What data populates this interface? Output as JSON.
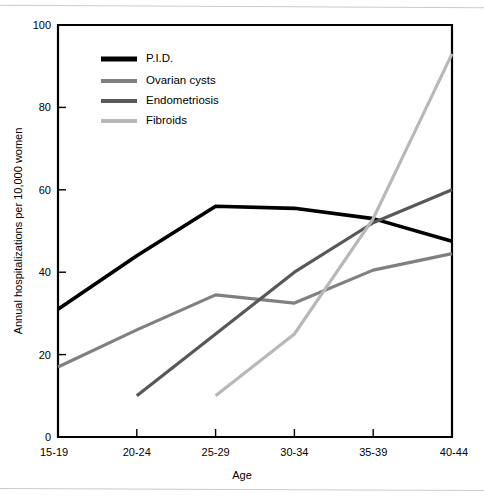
{
  "chart_data": {
    "type": "line",
    "title": "",
    "xlabel": "Age",
    "ylabel": "Annual hospitalizations per 10,000 women",
    "categories": [
      "15-19",
      "20-24",
      "25-29",
      "30-34",
      "35-39",
      "40-44"
    ],
    "ylim": [
      0,
      100
    ],
    "yticks": [
      0,
      20,
      40,
      60,
      80,
      100
    ],
    "ytick_labels": [
      "0",
      "20",
      "40",
      "60",
      "80",
      "100"
    ],
    "grid": false,
    "legend_position": "top-left inside axes",
    "series": [
      {
        "name": "P.I.D.",
        "color": "#000000",
        "width": 3.6,
        "x": [
          "15-19",
          "20-24",
          "25-29",
          "30-34",
          "35-39",
          "40-44"
        ],
        "values": [
          31,
          44,
          56,
          55.5,
          53,
          47.5
        ]
      },
      {
        "name": "Ovarian cysts",
        "color": "#808080",
        "width": 3.2,
        "x": [
          "15-19",
          "20-24",
          "25-29",
          "30-34",
          "35-39",
          "40-44"
        ],
        "values": [
          17,
          26,
          34.5,
          32.5,
          40.5,
          44.5
        ]
      },
      {
        "name": "Endometriosis",
        "color": "#585858",
        "width": 3.2,
        "x": [
          "20-24",
          "25-29",
          "30-34",
          "35-39",
          "40-44"
        ],
        "values": [
          10,
          25,
          40,
          52,
          60
        ]
      },
      {
        "name": "Fibroids",
        "color": "#b8b8b8",
        "width": 3.2,
        "x": [
          "25-29",
          "30-34",
          "35-39",
          "40-44"
        ],
        "values": [
          10,
          25,
          53,
          93
        ]
      }
    ]
  },
  "axes": {
    "y_title": "Annual hospitalizations per 10,000 women",
    "x_title": "Age",
    "y_tick_0": "0",
    "y_tick_1": "20",
    "y_tick_2": "40",
    "y_tick_3": "60",
    "y_tick_4": "80",
    "y_tick_5": "100",
    "x_tick_0": "15-19",
    "x_tick_1": "20-24",
    "x_tick_2": "25-29",
    "x_tick_3": "30-34",
    "x_tick_4": "35-39",
    "x_tick_5": "40-44"
  },
  "legend": {
    "entries": [
      {
        "label": "P.I.D.",
        "color": "#000000"
      },
      {
        "label": "Ovarian cysts",
        "color": "#808080"
      },
      {
        "label": "Endometriosis",
        "color": "#585858"
      },
      {
        "label": "Fibroids",
        "color": "#b8b8b8"
      }
    ],
    "label_0": "P.I.D.",
    "label_1": "Ovarian cysts",
    "label_2": "Endometriosis",
    "label_3": "Fibroids"
  }
}
